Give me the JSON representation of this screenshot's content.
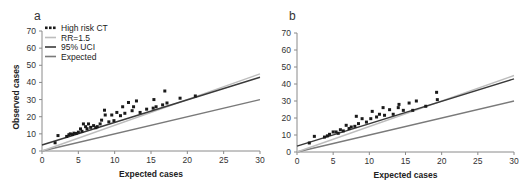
{
  "chart_data": [
    {
      "panel": "a",
      "type": "scatter",
      "title": "",
      "xlabel": "Expected cases",
      "ylabel": "Observed cases",
      "xlim": [
        0,
        30
      ],
      "ylim": [
        0,
        70
      ],
      "xticks": [
        0,
        5,
        10,
        15,
        20,
        25,
        30
      ],
      "yticks": [
        0,
        10,
        20,
        30,
        40,
        50,
        60,
        70
      ],
      "grid": false,
      "legend_position": "upper-left",
      "legend": [
        "High risk CT",
        "RR=1.5",
        "95% UCI",
        "Expected"
      ],
      "series": [
        {
          "name": "High risk CT",
          "kind": "points",
          "points": [
            [
              1.8,
              4.8
            ],
            [
              2.2,
              9
            ],
            [
              3.4,
              8.5
            ],
            [
              3.7,
              9.5
            ],
            [
              3.9,
              10
            ],
            [
              4.2,
              9.6
            ],
            [
              4.4,
              10.4
            ],
            [
              4.7,
              10.2
            ],
            [
              5,
              11
            ],
            [
              5.3,
              12.9
            ],
            [
              5.5,
              11.5
            ],
            [
              5.7,
              15.8
            ],
            [
              6,
              14.2
            ],
            [
              6.2,
              13
            ],
            [
              6.4,
              15.8
            ],
            [
              6.7,
              13.8
            ],
            [
              7.1,
              14.8
            ],
            [
              7.4,
              13.6
            ],
            [
              7.6,
              14.2
            ],
            [
              8,
              15.8
            ],
            [
              8.2,
              18
            ],
            [
              8.6,
              23.8
            ],
            [
              8.7,
              21
            ],
            [
              9.2,
              17
            ],
            [
              9.6,
              21
            ],
            [
              9.9,
              17.7
            ],
            [
              10.3,
              22.5
            ],
            [
              10.8,
              20.6
            ],
            [
              11.1,
              25.8
            ],
            [
              11.4,
              22
            ],
            [
              11.9,
              28.3
            ],
            [
              12.4,
              23.5
            ],
            [
              12.6,
              25.8
            ],
            [
              13,
              29.2
            ],
            [
              13.5,
              22.5
            ],
            [
              14.4,
              24.4
            ],
            [
              15.3,
              25
            ],
            [
              15.4,
              30
            ],
            [
              15.7,
              25.8
            ],
            [
              16.6,
              26.9
            ],
            [
              16.9,
              35
            ],
            [
              17.2,
              28
            ],
            [
              19,
              30.8
            ],
            [
              21.1,
              32.1
            ]
          ]
        },
        {
          "name": "RR=1.5",
          "kind": "line",
          "x": [
            0,
            30
          ],
          "y": [
            0,
            45
          ],
          "color": "#bdbdbd"
        },
        {
          "name": "95% UCI",
          "kind": "line",
          "x": [
            0,
            30
          ],
          "y": [
            3.5,
            43
          ],
          "color": "#3a3a3a"
        },
        {
          "name": "Expected",
          "kind": "line",
          "x": [
            0,
            30
          ],
          "y": [
            0,
            30
          ],
          "color": "#7a7a7a"
        }
      ]
    },
    {
      "panel": "b",
      "type": "scatter",
      "title": "",
      "xlabel": "Expected cases",
      "ylabel": "",
      "xlim": [
        0,
        30
      ],
      "ylim": [
        0,
        70
      ],
      "xticks": [
        0,
        5,
        10,
        15,
        20,
        25,
        30
      ],
      "yticks": [
        0,
        10,
        20,
        30,
        40,
        50,
        60,
        70
      ],
      "grid": false,
      "legend": [],
      "series": [
        {
          "name": "High risk CT",
          "kind": "points",
          "points": [
            [
              1.7,
              5.3
            ],
            [
              2.4,
              9.2
            ],
            [
              3.8,
              8.8
            ],
            [
              4.2,
              9.5
            ],
            [
              4.5,
              10.4
            ],
            [
              5,
              11.8
            ],
            [
              5.4,
              11.8
            ],
            [
              5.7,
              11
            ],
            [
              6,
              13.1
            ],
            [
              6.4,
              12.4
            ],
            [
              6.8,
              15.7
            ],
            [
              7.2,
              13.8
            ],
            [
              7.5,
              14.7
            ],
            [
              8,
              15.1
            ],
            [
              8.2,
              21
            ],
            [
              8.5,
              16.7
            ],
            [
              9,
              19.6
            ],
            [
              9.6,
              17.6
            ],
            [
              10.2,
              19.6
            ],
            [
              10.4,
              23.9
            ],
            [
              11,
              20.6
            ],
            [
              11.4,
              22.2
            ],
            [
              11.9,
              26.1
            ],
            [
              12.1,
              21.6
            ],
            [
              12.8,
              24.9
            ],
            [
              13.3,
              22.2
            ],
            [
              14,
              26.1
            ],
            [
              14.1,
              28
            ],
            [
              14.7,
              24.5
            ],
            [
              15.5,
              28.8
            ],
            [
              16,
              24.5
            ],
            [
              16.5,
              30
            ],
            [
              17.8,
              26.9
            ],
            [
              19.3,
              35.1
            ],
            [
              19.4,
              30.8
            ]
          ]
        },
        {
          "name": "RR=1.5",
          "kind": "line",
          "x": [
            0,
            30
          ],
          "y": [
            0,
            45
          ],
          "color": "#bdbdbd"
        },
        {
          "name": "95% UCI",
          "kind": "line",
          "x": [
            0,
            30
          ],
          "y": [
            3.5,
            43
          ],
          "color": "#3a3a3a"
        },
        {
          "name": "Expected",
          "kind": "line",
          "x": [
            0,
            30
          ],
          "y": [
            0,
            30
          ],
          "color": "#7a7a7a"
        }
      ]
    }
  ],
  "panels": {
    "a": {
      "label": "a",
      "xlabel": "Expected cases",
      "ylabel": "Observed cases"
    },
    "b": {
      "label": "b",
      "xlabel": "Expected cases"
    }
  },
  "legend": {
    "items": [
      {
        "label": "High risk CT",
        "marker": "dots",
        "color": "#1a1a1a"
      },
      {
        "label": "RR=1.5",
        "marker": "line",
        "color": "#bdbdbd"
      },
      {
        "label": "95% UCI",
        "marker": "line",
        "color": "#3a3a3a"
      },
      {
        "label": "Expected",
        "marker": "line",
        "color": "#7a7a7a"
      }
    ]
  },
  "layout": {
    "a": {
      "x0": 42,
      "x1": 260,
      "y0": 151,
      "y1": 31
    },
    "b": {
      "x0": 297,
      "x1": 514,
      "y0": 152,
      "y1": 33
    }
  }
}
